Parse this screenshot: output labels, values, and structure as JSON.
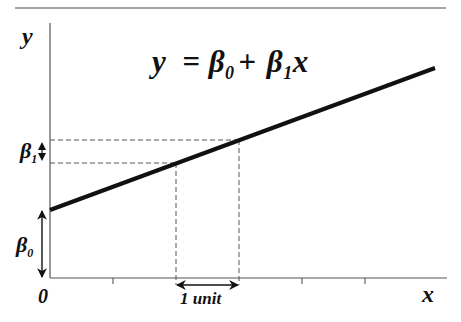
{
  "diagram": {
    "title_equation": {
      "lhs": "y",
      "equals": "=",
      "beta0": "β",
      "beta0_sub": "0",
      "plus": "+",
      "beta1": "β",
      "beta1_sub": "1",
      "var": "x"
    },
    "axes": {
      "y_label": "y",
      "x_label": "x",
      "origin_label": "0"
    },
    "annotations": {
      "intercept_label": "β",
      "intercept_sub": "0",
      "slope_label": "β",
      "slope_sub": "1",
      "run_label": "1 unit"
    },
    "colors": {
      "line": "#111111",
      "axis": "#555555",
      "dashed": "#555555",
      "rule": "#888888"
    }
  }
}
